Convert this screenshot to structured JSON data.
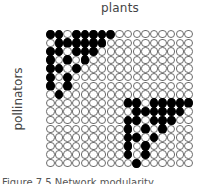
{
  "labels": {
    "columns": "plants",
    "rows": "pollinators"
  },
  "caption": "Figure 7.5 Network modularity",
  "colors": {
    "filled": "#000000",
    "empty": "#ffffff",
    "outline": "#6b6b6b"
  },
  "matrix": {
    "n_rows": 16,
    "n_cols": 17,
    "row_axis": "pollinators",
    "col_axis": "plants",
    "cells": [
      [
        1,
        1,
        0,
        1,
        1,
        1,
        1,
        1,
        0,
        0,
        0,
        0,
        0,
        0,
        0,
        0,
        0
      ],
      [
        0,
        1,
        1,
        1,
        1,
        1,
        1,
        0,
        0,
        0,
        0,
        0,
        0,
        0,
        0,
        0,
        0
      ],
      [
        1,
        1,
        0,
        1,
        1,
        1,
        0,
        0,
        0,
        0,
        0,
        0,
        0,
        0,
        0,
        0,
        0
      ],
      [
        1,
        0,
        1,
        0,
        1,
        0,
        0,
        0,
        0,
        0,
        0,
        0,
        0,
        0,
        0,
        0,
        0
      ],
      [
        1,
        1,
        0,
        1,
        0,
        0,
        0,
        0,
        0,
        0,
        0,
        0,
        0,
        0,
        0,
        0,
        0
      ],
      [
        1,
        0,
        1,
        0,
        0,
        0,
        0,
        0,
        0,
        0,
        0,
        0,
        0,
        0,
        0,
        0,
        0
      ],
      [
        1,
        0,
        1,
        0,
        0,
        0,
        0,
        0,
        0,
        0,
        0,
        0,
        0,
        0,
        0,
        0,
        0
      ],
      [
        0,
        1,
        0,
        0,
        0,
        0,
        0,
        0,
        0,
        0,
        0,
        0,
        0,
        0,
        0,
        0,
        0
      ],
      [
        0,
        0,
        0,
        0,
        0,
        0,
        0,
        0,
        0,
        1,
        1,
        0,
        1,
        1,
        1,
        1,
        1
      ],
      [
        0,
        0,
        0,
        0,
        0,
        0,
        0,
        0,
        0,
        0,
        1,
        1,
        1,
        1,
        1,
        1,
        0
      ],
      [
        0,
        0,
        0,
        0,
        0,
        0,
        0,
        0,
        0,
        1,
        1,
        0,
        1,
        1,
        1,
        0,
        0
      ],
      [
        0,
        0,
        0,
        0,
        0,
        0,
        0,
        0,
        0,
        1,
        0,
        1,
        0,
        1,
        0,
        0,
        0
      ],
      [
        0,
        0,
        0,
        0,
        0,
        0,
        0,
        0,
        0,
        1,
        1,
        0,
        1,
        0,
        0,
        0,
        0
      ],
      [
        0,
        0,
        0,
        0,
        0,
        0,
        0,
        0,
        0,
        1,
        0,
        1,
        0,
        0,
        0,
        0,
        0
      ],
      [
        0,
        0,
        0,
        0,
        0,
        0,
        0,
        0,
        0,
        1,
        0,
        1,
        0,
        0,
        0,
        0,
        0
      ],
      [
        0,
        0,
        0,
        0,
        0,
        0,
        0,
        0,
        0,
        0,
        1,
        0,
        0,
        0,
        0,
        0,
        0
      ]
    ],
    "modules": [
      {
        "name": "module-1",
        "rows": [
          1,
          8
        ],
        "cols": [
          1,
          8
        ]
      },
      {
        "name": "module-2",
        "rows": [
          9,
          16
        ],
        "cols": [
          10,
          17
        ]
      }
    ]
  }
}
